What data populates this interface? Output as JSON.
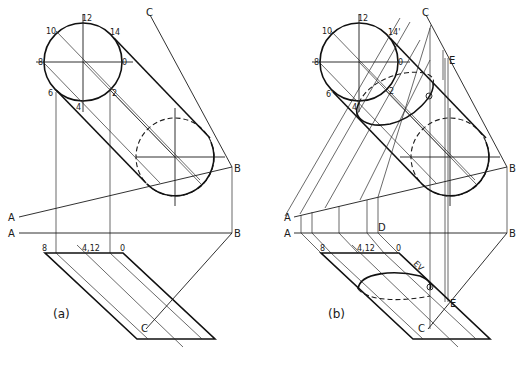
{
  "figure": {
    "panels": [
      {
        "id": "a",
        "caption": "(a)",
        "circle_labels": {
          "p12": "12",
          "p10": "10",
          "p14": "14",
          "p8": "8",
          "p0": "0",
          "p6": "6",
          "p4": "4",
          "p2": "2"
        },
        "points": {
          "A1": "A",
          "A2": "A",
          "B1": "B",
          "B2": "B",
          "C1": "C",
          "C2": "C"
        },
        "plan_labels": {
          "p8": "8",
          "p412": "4,12",
          "p0": "0"
        }
      },
      {
        "id": "b",
        "caption": "(b)",
        "circle_labels": {
          "p12": "12",
          "p10": "10",
          "p14": "14'",
          "p8": "8",
          "p0": "0",
          "p6": "6'",
          "p4": "4'",
          "p2": "2"
        },
        "points": {
          "A1": "A",
          "A2": "A",
          "B1": "B",
          "B2": "B",
          "C1": "C",
          "C2": "C",
          "D": "D",
          "E1": "E",
          "E2": "E"
        },
        "plan_labels": {
          "p8": "8",
          "p412": "4,12",
          "p0": "0"
        },
        "edge_view_label": "EV"
      }
    ]
  }
}
